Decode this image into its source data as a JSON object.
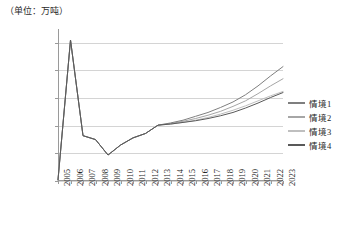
{
  "chart_data": {
    "type": "line",
    "title": "",
    "unit_note": "（单位：万吨）",
    "xlabel": "",
    "ylabel": "",
    "grid": true,
    "legend_position": "right",
    "ylim": [
      590000,
      865000
    ],
    "yticks": [
      590000,
      640000,
      690000,
      740000,
      790000,
      840000
    ],
    "ytick_labels": [
      "590000",
      "640000",
      "690000",
      "740000",
      "790000",
      "840000"
    ],
    "categories": [
      "2005",
      "2006",
      "2007",
      "2008",
      "2009",
      "2010",
      "2011",
      "2012",
      "2013",
      "2014",
      "2015",
      "2016",
      "2017",
      "2018",
      "2019",
      "2020",
      "2021",
      "2022",
      "2023"
    ],
    "series": [
      {
        "name": "情境1",
        "color": "#7f7f7f",
        "values": [
          592000,
          845000,
          672000,
          665000,
          637000,
          655000,
          668000,
          676000,
          691000,
          695000,
          700000,
          707000,
          714000,
          723000,
          733000,
          746000,
          762000,
          780000,
          797000
        ]
      },
      {
        "name": "情境2",
        "color": "#a6a6a6",
        "values": [
          592000,
          845000,
          672000,
          665000,
          637000,
          655000,
          668000,
          676000,
          691000,
          694000,
          698000,
          703000,
          709000,
          716000,
          725000,
          735000,
          748000,
          762000,
          775000
        ]
      },
      {
        "name": "情境3",
        "color": "#bfbfbf",
        "values": [
          592000,
          845000,
          672000,
          665000,
          637000,
          655000,
          668000,
          676000,
          691000,
          693000,
          696000,
          700000,
          705000,
          711000,
          718000,
          726000,
          735000,
          744000,
          752000
        ]
      },
      {
        "name": "情境4",
        "color": "#595959",
        "values": [
          592000,
          845000,
          672000,
          665000,
          637000,
          655000,
          668000,
          676000,
          691000,
          693000,
          696000,
          699000,
          703000,
          708000,
          714000,
          722000,
          731000,
          741000,
          750000
        ]
      }
    ]
  },
  "legend": {
    "items": [
      {
        "label": "情境1"
      },
      {
        "label": "情境2"
      },
      {
        "label": "情境3"
      },
      {
        "label": "情境4"
      }
    ]
  }
}
